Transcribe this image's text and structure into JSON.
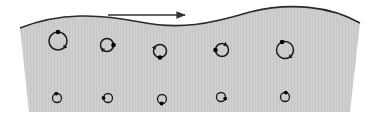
{
  "diagram": {
    "type": "wave-particle-orbits",
    "colors": {
      "water_fill": "#cfcfcf",
      "water_stripe": "#c4c4c4",
      "surface_line": "#2a2a2a",
      "orbit_stroke": "#1a1a1a",
      "particle": "#000000",
      "arrow": "#333333",
      "background": "#ffffff"
    },
    "arrow": {
      "direction": "right",
      "x1": 108,
      "y1": 15,
      "x2": 185,
      "y2": 15
    },
    "surface_path": "M20,28 C60,12 100,14 140,22 C180,30 210,24 250,12 C290,2 330,6 360,23",
    "water_polygon_bottom": {
      "left": [
        29,
        112
      ],
      "right": [
        350,
        112
      ]
    },
    "orbits": {
      "top_row": [
        {
          "cx": 58,
          "cy": 41,
          "r": 9,
          "dot_angle_deg": -90,
          "arrow_angle_deg": 40
        },
        {
          "cx": 107,
          "cy": 45,
          "r": 6.5,
          "dot_angle_deg": 0,
          "arrow_angle_deg": 130
        },
        {
          "cx": 160,
          "cy": 51,
          "r": 6.5,
          "dot_angle_deg": 90,
          "arrow_angle_deg": -150
        },
        {
          "cx": 222,
          "cy": 50,
          "r": 6.5,
          "dot_angle_deg": 180,
          "arrow_angle_deg": -60
        },
        {
          "cx": 285,
          "cy": 50,
          "r": 8.5,
          "dot_angle_deg": -110,
          "arrow_angle_deg": 50
        }
      ],
      "bottom_row": [
        {
          "cx": 57,
          "cy": 98,
          "r": 4.5,
          "dot_angle_deg": -100
        },
        {
          "cx": 108,
          "cy": 98,
          "r": 4.5,
          "dot_angle_deg": 180
        },
        {
          "cx": 162,
          "cy": 99,
          "r": 4.5,
          "dot_angle_deg": 95
        },
        {
          "cx": 221,
          "cy": 97,
          "r": 4.5,
          "dot_angle_deg": 20
        },
        {
          "cx": 285,
          "cy": 97,
          "r": 4.5,
          "dot_angle_deg": -80
        }
      ]
    }
  }
}
